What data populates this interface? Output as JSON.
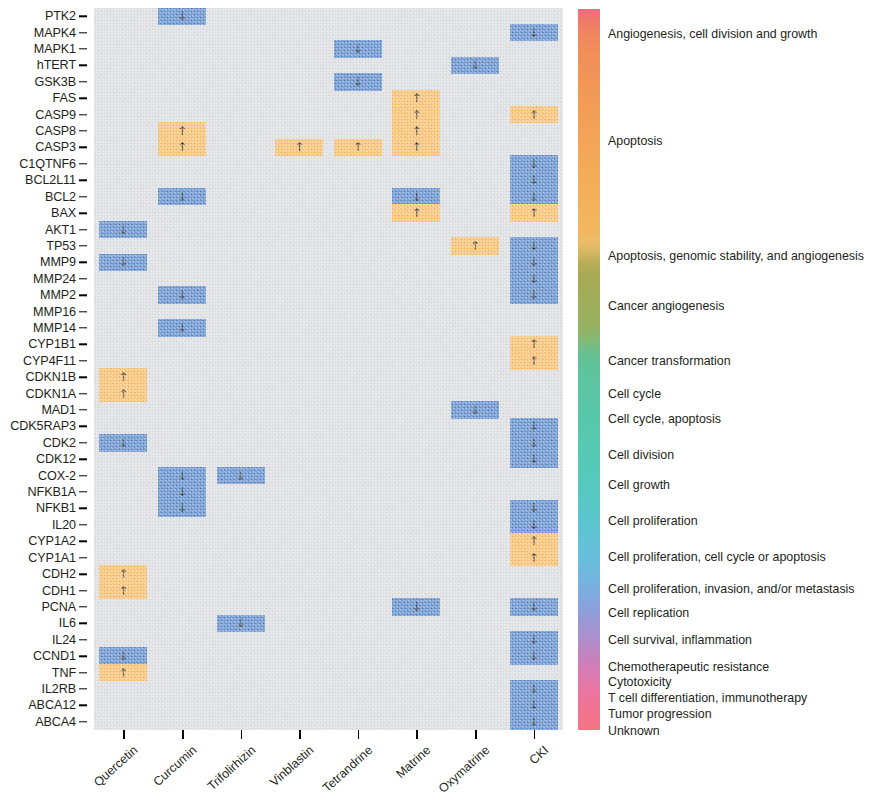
{
  "chart_data": {
    "type": "heatmap",
    "title": "",
    "xlabel": "",
    "ylabel": "",
    "grid": false,
    "legend_position": "right",
    "categories": [
      "Quercetin",
      "Curcumin",
      "Trifolirhizin",
      "Vinblastin",
      "Tetrandrine",
      "Matrine",
      "Oxymatrine",
      "CKI"
    ],
    "genes": [
      "PTK2",
      "MAPK4",
      "MAPK1",
      "hTERT",
      "GSK3B",
      "FAS",
      "CASP9",
      "CASP8",
      "CASP3",
      "C1QTNF6",
      "BCL2L11",
      "BCL2",
      "BAX",
      "AKT1",
      "TP53",
      "MMP9",
      "MMP24",
      "MMP2",
      "MMP16",
      "MMP14",
      "CYP1B1",
      "CYP4F11",
      "CDKN1B",
      "CDKN1A",
      "MAD1",
      "CDK5RAP3",
      "CDK2",
      "CDK12",
      "COX-2",
      "NFKB1A",
      "NFKB1",
      "IL20",
      "CYP1A2",
      "CYP1A1",
      "CDH2",
      "CDH1",
      "PCNA",
      "IL6",
      "IL24",
      "CCND1",
      "TNF",
      "IL2RB",
      "ABCA12",
      "ABCA4"
    ],
    "value_encoding": {
      "up": {
        "label": "Up-regulated",
        "color": "#f7b85c",
        "glyph": "↑"
      },
      "down": {
        "label": "Down-regulated",
        "color": "#4f81c7",
        "glyph": "↓"
      },
      "none": {
        "label": "No effect",
        "color": "#d8dade",
        "glyph": ""
      }
    },
    "cells": [
      {
        "gene": "PTK2",
        "compound": "Curcumin",
        "value": "down"
      },
      {
        "gene": "MAPK4",
        "compound": "CKI",
        "value": "down"
      },
      {
        "gene": "MAPK1",
        "compound": "Tetrandrine",
        "value": "down"
      },
      {
        "gene": "hTERT",
        "compound": "Oxymatrine",
        "value": "down"
      },
      {
        "gene": "GSK3B",
        "compound": "Tetrandrine",
        "value": "down"
      },
      {
        "gene": "FAS",
        "compound": "Matrine",
        "value": "up"
      },
      {
        "gene": "CASP9",
        "compound": "Matrine",
        "value": "up"
      },
      {
        "gene": "CASP9",
        "compound": "CKI",
        "value": "up"
      },
      {
        "gene": "CASP8",
        "compound": "Curcumin",
        "value": "up"
      },
      {
        "gene": "CASP8",
        "compound": "Matrine",
        "value": "up"
      },
      {
        "gene": "CASP3",
        "compound": "Curcumin",
        "value": "up"
      },
      {
        "gene": "CASP3",
        "compound": "Vinblastin",
        "value": "up"
      },
      {
        "gene": "CASP3",
        "compound": "Tetrandrine",
        "value": "up"
      },
      {
        "gene": "CASP3",
        "compound": "Matrine",
        "value": "up"
      },
      {
        "gene": "C1QTNF6",
        "compound": "CKI",
        "value": "down"
      },
      {
        "gene": "BCL2L11",
        "compound": "CKI",
        "value": "down"
      },
      {
        "gene": "BCL2",
        "compound": "Curcumin",
        "value": "down"
      },
      {
        "gene": "BCL2",
        "compound": "Matrine",
        "value": "down"
      },
      {
        "gene": "BCL2",
        "compound": "CKI",
        "value": "down"
      },
      {
        "gene": "BAX",
        "compound": "Matrine",
        "value": "up"
      },
      {
        "gene": "BAX",
        "compound": "CKI",
        "value": "up"
      },
      {
        "gene": "AKT1",
        "compound": "Quercetin",
        "value": "down"
      },
      {
        "gene": "TP53",
        "compound": "Oxymatrine",
        "value": "up"
      },
      {
        "gene": "TP53",
        "compound": "CKI",
        "value": "down"
      },
      {
        "gene": "MMP9",
        "compound": "Quercetin",
        "value": "down"
      },
      {
        "gene": "MMP9",
        "compound": "CKI",
        "value": "down"
      },
      {
        "gene": "MMP24",
        "compound": "CKI",
        "value": "down"
      },
      {
        "gene": "MMP2",
        "compound": "Curcumin",
        "value": "down"
      },
      {
        "gene": "MMP2",
        "compound": "CKI",
        "value": "down"
      },
      {
        "gene": "MMP14",
        "compound": "Curcumin",
        "value": "down"
      },
      {
        "gene": "CYP1B1",
        "compound": "CKI",
        "value": "up"
      },
      {
        "gene": "CYP4F11",
        "compound": "CKI",
        "value": "up"
      },
      {
        "gene": "CDKN1B",
        "compound": "Quercetin",
        "value": "up"
      },
      {
        "gene": "CDKN1A",
        "compound": "Quercetin",
        "value": "up"
      },
      {
        "gene": "MAD1",
        "compound": "Oxymatrine",
        "value": "down"
      },
      {
        "gene": "CDK5RAP3",
        "compound": "CKI",
        "value": "down"
      },
      {
        "gene": "CDK2",
        "compound": "Quercetin",
        "value": "down"
      },
      {
        "gene": "CDK2",
        "compound": "CKI",
        "value": "down"
      },
      {
        "gene": "CDK12",
        "compound": "CKI",
        "value": "down"
      },
      {
        "gene": "COX-2",
        "compound": "Curcumin",
        "value": "down"
      },
      {
        "gene": "COX-2",
        "compound": "Trifolirhizin",
        "value": "down"
      },
      {
        "gene": "NFKB1A",
        "compound": "Curcumin",
        "value": "down"
      },
      {
        "gene": "NFKB1",
        "compound": "Curcumin",
        "value": "down"
      },
      {
        "gene": "NFKB1",
        "compound": "CKI",
        "value": "down"
      },
      {
        "gene": "IL20",
        "compound": "CKI",
        "value": "down"
      },
      {
        "gene": "CYP1A2",
        "compound": "CKI",
        "value": "up"
      },
      {
        "gene": "CYP1A1",
        "compound": "CKI",
        "value": "up"
      },
      {
        "gene": "CDH2",
        "compound": "Quercetin",
        "value": "up"
      },
      {
        "gene": "CDH1",
        "compound": "Quercetin",
        "value": "up"
      },
      {
        "gene": "PCNA",
        "compound": "Matrine",
        "value": "down"
      },
      {
        "gene": "PCNA",
        "compound": "CKI",
        "value": "down"
      },
      {
        "gene": "IL6",
        "compound": "Trifolirhizin",
        "value": "down"
      },
      {
        "gene": "IL24",
        "compound": "CKI",
        "value": "down"
      },
      {
        "gene": "CCND1",
        "compound": "Quercetin",
        "value": "down"
      },
      {
        "gene": "CCND1",
        "compound": "CKI",
        "value": "down"
      },
      {
        "gene": "TNF",
        "compound": "Quercetin",
        "value": "up"
      },
      {
        "gene": "IL2RB",
        "compound": "CKI",
        "value": "down"
      },
      {
        "gene": "ABCA12",
        "compound": "CKI",
        "value": "down"
      },
      {
        "gene": "ABCA4",
        "compound": "CKI",
        "value": "down"
      }
    ],
    "legend_title": "",
    "legend_entries": [
      {
        "label": "Angiogenesis, cell division and growth",
        "color": "#f2647b",
        "y": 25
      },
      {
        "label": "Apoptosis",
        "color": "#f79b4f",
        "y": 132
      },
      {
        "label": "Apoptosis, genomic stability, and angiogenesis",
        "color": "#f5bd60",
        "y": 247
      },
      {
        "label": "Cancer angiogenesis",
        "color": "#a9a94c",
        "y": 297
      },
      {
        "label": "Cancer transformation",
        "color": "#8fb25e",
        "y": 352
      },
      {
        "label": "Cell cycle",
        "color": "#5ec290",
        "y": 385
      },
      {
        "label": "Cell cycle, apoptosis",
        "color": "#53c7a2",
        "y": 410
      },
      {
        "label": "Cell division",
        "color": "#4fc9b2",
        "y": 446
      },
      {
        "label": "Cell growth",
        "color": "#4ec9bf",
        "y": 476
      },
      {
        "label": "Cell proliferation",
        "color": "#52c7cb",
        "y": 512
      },
      {
        "label": "Cell proliferation, cell cycle or apoptosis",
        "color": "#5ec2dd",
        "y": 548
      },
      {
        "label": "Cell proliferation, invasion, and/or metastasis",
        "color": "#6fb3e1",
        "y": 580
      },
      {
        "label": "Cell replication",
        "color": "#7ba8e0",
        "y": 604
      },
      {
        "label": "Cell survival, inflammation",
        "color": "#9296d7",
        "y": 631
      },
      {
        "label": "Chemotherapeutic resistance",
        "color": "#b985c6",
        "y": 658
      },
      {
        "label": "Cytotoxicity",
        "color": "#cd7bbb",
        "y": 673
      },
      {
        "label": "T cell differentiation, immunotherapy",
        "color": "#df76ae",
        "y": 689
      },
      {
        "label": "Tumor progression",
        "color": "#ec71a0",
        "y": 705
      },
      {
        "label": "Unknown",
        "color": "#f36f92",
        "y": 722
      }
    ],
    "colorbar": {
      "orientation": "vertical",
      "top_color": "#f2647b",
      "bottom_color": "#f36f92"
    }
  }
}
